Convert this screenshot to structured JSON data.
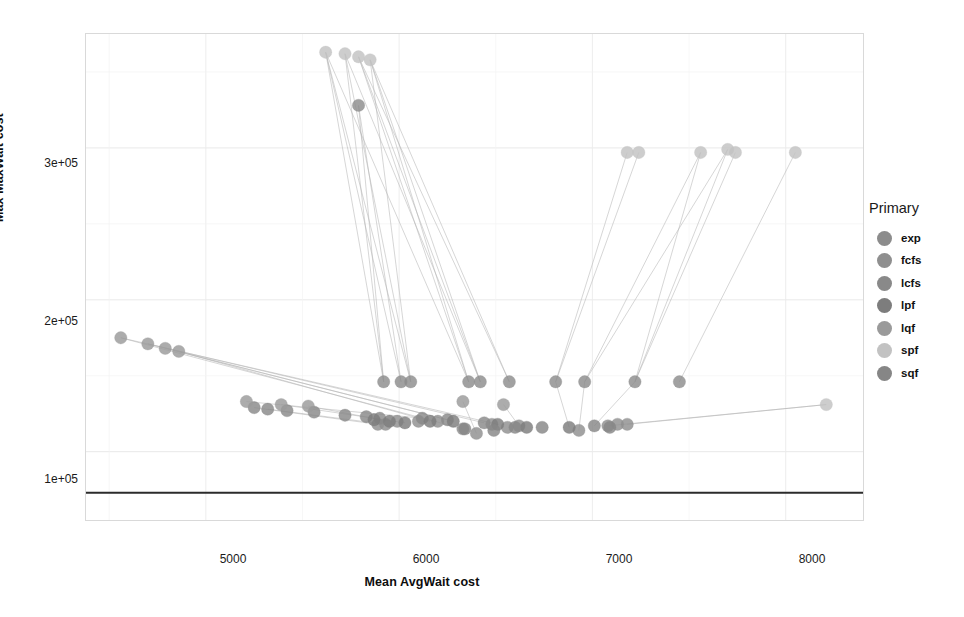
{
  "chart_data": {
    "type": "scatter",
    "title": "",
    "xlabel": "Mean AvgWait cost",
    "ylabel": "Max MaxWait cost",
    "xlim": [
      4380,
      8400
    ],
    "ylim": [
      55000,
      375000
    ],
    "xticks": [
      5000,
      6000,
      7000,
      8000
    ],
    "xticklabels": [
      "5000",
      "6000",
      "7000",
      "8000"
    ],
    "yticks": [
      100000,
      200000,
      300000
    ],
    "yticklabels": [
      "1e+05",
      "2e+05",
      "3e+05"
    ],
    "grid": true,
    "legend": {
      "title": "Primary",
      "position": "right",
      "entries": [
        {
          "label": "exp",
          "color": "#8c8c8c"
        },
        {
          "label": "fcfs",
          "color": "#8f8f8f"
        },
        {
          "label": "lcfs",
          "color": "#898989"
        },
        {
          "label": "lpf",
          "color": "#7d7d7d"
        },
        {
          "label": "lqf",
          "color": "#9a9a9a"
        },
        {
          "label": "spf",
          "color": "#c2c2c2"
        },
        {
          "label": "sqf",
          "color": "#868686"
        }
      ]
    },
    "reference_line": {
      "y": 73000,
      "color": "#2b2b2b",
      "width": 2
    },
    "series": [
      {
        "name": "exp",
        "color": "#8c8c8c",
        "points": [
          [
            5920,
            146000
          ],
          [
            6010,
            146000
          ],
          [
            6060,
            146000
          ],
          [
            6360,
            146000
          ],
          [
            6420,
            146000
          ],
          [
            6570,
            146000
          ],
          [
            6810,
            146000
          ],
          [
            6960,
            146000
          ],
          [
            7220,
            146000
          ],
          [
            7450,
            146000
          ],
          [
            5790,
            328000
          ]
        ]
      },
      {
        "name": "fcfs",
        "color": "#8f8f8f",
        "points": [
          [
            5890,
            118000
          ],
          [
            5930,
            118000
          ],
          [
            5990,
            120000
          ],
          [
            6100,
            120000
          ],
          [
            6200,
            120000
          ],
          [
            6330,
            115000
          ],
          [
            6400,
            112000
          ],
          [
            6480,
            118000
          ],
          [
            6560,
            116000
          ],
          [
            6620,
            117000
          ],
          [
            6930,
            114000
          ],
          [
            7080,
            117000
          ],
          [
            7130,
            118000
          ],
          [
            7180,
            118000
          ]
        ]
      },
      {
        "name": "lcfs",
        "color": "#898989",
        "points": [
          [
            5250,
            129000
          ],
          [
            5320,
            128000
          ],
          [
            5420,
            127000
          ],
          [
            5560,
            126000
          ],
          [
            5720,
            124000
          ],
          [
            5830,
            123000
          ],
          [
            5900,
            122000
          ],
          [
            6120,
            122000
          ],
          [
            6250,
            121000
          ],
          [
            6440,
            119000
          ]
        ]
      },
      {
        "name": "lpf",
        "color": "#7d7d7d",
        "points": [
          [
            5870,
            121000
          ],
          [
            5950,
            120000
          ],
          [
            6030,
            119000
          ],
          [
            6160,
            120000
          ],
          [
            6280,
            120000
          ],
          [
            6510,
            118000
          ],
          [
            6660,
            116000
          ],
          [
            6880,
            116000
          ]
        ]
      },
      {
        "name": "lqf",
        "color": "#9a9a9a",
        "points": [
          [
            4560,
            175000
          ],
          [
            4700,
            171000
          ],
          [
            4790,
            168000
          ],
          [
            4860,
            166000
          ],
          [
            5210,
            133000
          ],
          [
            5390,
            131000
          ],
          [
            5530,
            130000
          ],
          [
            6330,
            133000
          ],
          [
            6540,
            131000
          ]
        ]
      },
      {
        "name": "spf",
        "color": "#c2c2c2",
        "points": [
          [
            5620,
            363000
          ],
          [
            5720,
            362000
          ],
          [
            5790,
            360000
          ],
          [
            5850,
            358000
          ],
          [
            7180,
            297000
          ],
          [
            7240,
            297000
          ],
          [
            7560,
            297000
          ],
          [
            7700,
            299000
          ],
          [
            7740,
            297000
          ],
          [
            8050,
            297000
          ],
          [
            8210,
            131000
          ]
        ]
      },
      {
        "name": "sqf",
        "color": "#868686",
        "points": [
          [
            6340,
            115000
          ],
          [
            6490,
            114000
          ],
          [
            6600,
            116000
          ],
          [
            6740,
            116000
          ],
          [
            7010,
            117000
          ],
          [
            7090,
            116000
          ]
        ]
      }
    ],
    "connector_segments": [
      [
        5620,
        363000,
        6360,
        146000
      ],
      [
        5720,
        362000,
        6420,
        146000
      ],
      [
        5790,
        360000,
        6570,
        146000
      ],
      [
        5850,
        358000,
        6060,
        146000
      ],
      [
        5790,
        328000,
        6010,
        146000
      ],
      [
        5790,
        328000,
        5920,
        146000
      ],
      [
        5620,
        363000,
        6010,
        146000
      ],
      [
        5720,
        362000,
        6060,
        146000
      ],
      [
        5850,
        358000,
        6420,
        146000
      ],
      [
        5790,
        360000,
        6360,
        146000
      ],
      [
        5620,
        363000,
        5920,
        146000
      ],
      [
        5720,
        362000,
        5920,
        146000
      ],
      [
        5850,
        358000,
        6360,
        146000
      ],
      [
        5790,
        360000,
        6420,
        146000
      ],
      [
        5620,
        363000,
        6060,
        146000
      ],
      [
        5850,
        358000,
        6570,
        146000
      ],
      [
        7180,
        297000,
        6810,
        146000
      ],
      [
        7240,
        297000,
        6810,
        146000
      ],
      [
        7560,
        297000,
        6960,
        146000
      ],
      [
        7700,
        299000,
        6960,
        146000
      ],
      [
        7740,
        297000,
        7220,
        146000
      ],
      [
        7560,
        297000,
        7220,
        146000
      ],
      [
        8050,
        297000,
        7450,
        146000
      ],
      [
        7700,
        299000,
        7220,
        146000
      ],
      [
        4560,
        175000,
        6510,
        118000
      ],
      [
        4700,
        171000,
        6440,
        119000
      ],
      [
        4790,
        168000,
        6280,
        120000
      ],
      [
        4860,
        166000,
        6160,
        120000
      ],
      [
        4560,
        175000,
        6330,
        115000
      ],
      [
        4700,
        171000,
        6250,
        121000
      ],
      [
        5210,
        133000,
        6120,
        122000
      ],
      [
        5390,
        131000,
        6030,
        119000
      ],
      [
        5530,
        130000,
        5950,
        120000
      ],
      [
        5250,
        129000,
        5890,
        118000
      ],
      [
        5320,
        128000,
        5930,
        118000
      ],
      [
        6330,
        133000,
        6400,
        112000
      ],
      [
        6540,
        131000,
        6620,
        117000
      ],
      [
        8210,
        131000,
        7180,
        118000
      ],
      [
        8210,
        131000,
        7080,
        117000
      ],
      [
        6880,
        116000,
        6810,
        146000
      ],
      [
        6930,
        114000,
        6960,
        146000
      ],
      [
        7010,
        117000,
        7220,
        146000
      ]
    ]
  },
  "axis": {
    "x_title": "Mean AvgWait cost",
    "y_title": "Max MaxWait cost",
    "x_ticks": [
      "5000",
      "6000",
      "7000",
      "8000"
    ],
    "y_ticks": [
      "3e+05",
      "2e+05",
      "1e+05"
    ]
  },
  "legend": {
    "title": "Primary",
    "items": [
      {
        "label": "exp"
      },
      {
        "label": "fcfs"
      },
      {
        "label": "lcfs"
      },
      {
        "label": "lpf"
      },
      {
        "label": "lqf"
      },
      {
        "label": "spf"
      },
      {
        "label": "sqf"
      }
    ]
  }
}
